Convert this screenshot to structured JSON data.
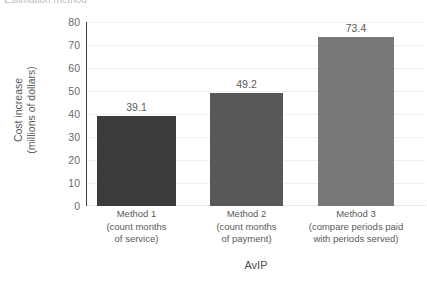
{
  "chart_data": {
    "type": "bar",
    "title": "Estimation method",
    "title_clipped": true,
    "xlabel": "AvIP",
    "ylabel_line1": "Cost increase",
    "ylabel_line2": "(millions of dollars)",
    "ylim": [
      0,
      80
    ],
    "ytick_labels": [
      "80",
      "70",
      "60",
      "50",
      "40",
      "30",
      "20",
      "10",
      "0"
    ],
    "ytick_values": [
      80,
      70,
      60,
      50,
      40,
      30,
      20,
      10,
      0
    ],
    "grid": true,
    "legend": "none",
    "categories": [
      "Method 1\n(count months of service)",
      "Method 2\n(count months of payment)",
      "Method 3\n(compare periods paid with periods served)"
    ],
    "values": [
      39.1,
      49.2,
      73.4
    ],
    "bars": [
      {
        "name": "Method 1",
        "sub_line1": "(count months",
        "sub_line2": "of service)",
        "value": 39.1,
        "value_label": "39.1",
        "color": "#3b3b3b"
      },
      {
        "name": "Method 2",
        "sub_line1": "(count months",
        "sub_line2": "of payment)",
        "value": 49.2,
        "value_label": "49.2",
        "color": "#585858"
      },
      {
        "name": "Method 3",
        "sub_line1": "(compare periods paid",
        "sub_line2": "with periods served)",
        "value": 73.4,
        "value_label": "73.4",
        "color": "#787878"
      }
    ],
    "colors": {
      "background": "#ffffff",
      "axis": "#3d3d3d",
      "gridline": "#f0f0f0",
      "text": "#5a5a5a"
    }
  }
}
